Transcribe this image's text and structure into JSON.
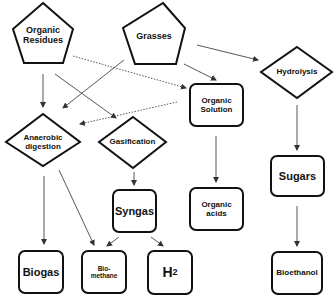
{
  "diagram": {
    "sources": [
      {
        "id": "organic_residues",
        "label_line1": "Organic",
        "label_line2": "Residues",
        "shape": "pentagon"
      },
      {
        "id": "grasses",
        "label": "Grasses",
        "shape": "pentagon"
      }
    ],
    "processes": [
      {
        "id": "hydrolysis",
        "label": "Hydrolysis",
        "shape": "diamond"
      },
      {
        "id": "anaerobic_digestion",
        "label_line1": "Anaerobic",
        "label_line2": "digestion",
        "shape": "diamond"
      },
      {
        "id": "gasification",
        "label": "Gasification",
        "shape": "diamond"
      }
    ],
    "intermediates": [
      {
        "id": "organic_solution",
        "label_line1": "Organic",
        "label_line2": "Solution",
        "shape": "rounded-rect"
      },
      {
        "id": "syngas",
        "label": "Syngas",
        "shape": "rounded-rect"
      },
      {
        "id": "sugars",
        "label": "Sugars",
        "shape": "rounded-rect"
      }
    ],
    "products": [
      {
        "id": "organic_acids",
        "label_line1": "Organic",
        "label_line2": "acids",
        "shape": "rounded-rect"
      },
      {
        "id": "biogas",
        "label": "Biogas",
        "shape": "rounded-rect"
      },
      {
        "id": "biomethane",
        "label_line1": "Bio-",
        "label_line2": "methane",
        "shape": "rounded-rect"
      },
      {
        "id": "h2",
        "label_main": "H",
        "label_sub": "2",
        "shape": "rounded-rect"
      },
      {
        "id": "bioethanol",
        "label": "Bioethanol",
        "shape": "rounded-rect"
      }
    ],
    "edges": [
      {
        "from": "organic_residues",
        "to": "anaerobic_digestion",
        "style": "solid"
      },
      {
        "from": "organic_residues",
        "to": "gasification",
        "style": "solid"
      },
      {
        "from": "organic_residues",
        "to": "organic_solution",
        "style": "dotted"
      },
      {
        "from": "grasses",
        "to": "anaerobic_digestion",
        "style": "solid"
      },
      {
        "from": "grasses",
        "to": "organic_solution",
        "style": "solid"
      },
      {
        "from": "grasses",
        "to": "hydrolysis",
        "style": "solid"
      },
      {
        "from": "organic_solution",
        "to": "anaerobic_digestion",
        "style": "dotted"
      },
      {
        "from": "organic_solution",
        "to": "organic_acids",
        "style": "solid"
      },
      {
        "from": "hydrolysis",
        "to": "sugars",
        "style": "solid"
      },
      {
        "from": "sugars",
        "to": "bioethanol",
        "style": "solid"
      },
      {
        "from": "anaerobic_digestion",
        "to": "biogas",
        "style": "solid"
      },
      {
        "from": "anaerobic_digestion",
        "to": "biomethane",
        "style": "solid"
      },
      {
        "from": "gasification",
        "to": "syngas",
        "style": "solid"
      },
      {
        "from": "syngas",
        "to": "biomethane",
        "style": "solid"
      },
      {
        "from": "syngas",
        "to": "h2",
        "style": "solid"
      }
    ],
    "colors": {
      "stroke": "#111111",
      "edge": "#444444",
      "background": "#ffffff"
    }
  }
}
